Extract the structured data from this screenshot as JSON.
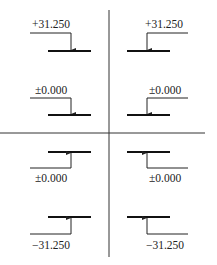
{
  "diagram": {
    "title": "",
    "type": "elevation-marks",
    "quadrants": [
      {
        "id": "top-left",
        "marks": [
          {
            "label": "+31.250",
            "direction": "down",
            "leader": "left"
          },
          {
            "label": "±0.000",
            "direction": "down",
            "leader": "left"
          }
        ]
      },
      {
        "id": "top-right",
        "marks": [
          {
            "label": "+31.250",
            "direction": "down",
            "leader": "right"
          },
          {
            "label": "±0.000",
            "direction": "down",
            "leader": "right"
          }
        ]
      },
      {
        "id": "bottom-left",
        "marks": [
          {
            "label": "±0.000",
            "direction": "up",
            "leader": "left"
          },
          {
            "label": "−31.250",
            "direction": "up",
            "leader": "left"
          }
        ]
      },
      {
        "id": "bottom-right",
        "marks": [
          {
            "label": "±0.000",
            "direction": "up",
            "leader": "right"
          },
          {
            "label": "−31.250",
            "direction": "up",
            "leader": "right"
          }
        ]
      }
    ],
    "colors": {
      "line": "#222222",
      "background": "#ffffff"
    }
  }
}
